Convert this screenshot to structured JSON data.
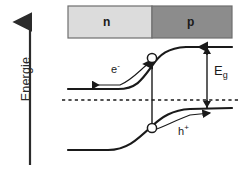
{
  "figure": {
    "axis": {
      "label": "Energie",
      "direction": "up",
      "arrow_icon": "up-arrow-icon"
    },
    "material_bar": {
      "n_region": {
        "label": "n",
        "color": "#dcdcdc",
        "x": 68,
        "width": 84
      },
      "p_region": {
        "label": "p",
        "color": "#8c8c8c",
        "x": 152,
        "width": 80
      },
      "border_color": "#6e6e6e",
      "y": 6,
      "height": 32
    },
    "bands": {
      "conduction_band": {
        "name": "conduction-band",
        "left_level": 89,
        "right_level": 47,
        "color": "#1a1a1a"
      },
      "valence_band": {
        "name": "valence-band",
        "left_level": 150,
        "right_level": 108,
        "color": "#1a1a1a"
      },
      "fermi_level": {
        "name": "fermi-level",
        "y": 100,
        "style": "dashed",
        "color": "#1a1a1a"
      }
    },
    "carriers": {
      "electron": {
        "label": "e",
        "charge": "-",
        "marker": "open-circle",
        "marker_x": 152,
        "marker_y": 58,
        "drift_direction": "left"
      },
      "hole": {
        "label": "h",
        "charge": "+",
        "marker": "open-circle",
        "marker_x": 152,
        "marker_y": 128,
        "drift_direction": "right"
      }
    },
    "band_gap": {
      "label": "E",
      "subscript": "g",
      "arrow_top_y": 47,
      "arrow_bottom_y": 108,
      "arrow_x": 207
    },
    "transition_arrow": {
      "name": "photo-excitation-arrow",
      "x": 152,
      "from_y": 128,
      "to_y": 60
    },
    "colors": {
      "background": "#ffffff",
      "ink": "#1a1a1a",
      "n_fill": "#dcdcdc",
      "p_fill": "#8c8c8c",
      "bar_stroke": "#6e6e6e"
    }
  }
}
